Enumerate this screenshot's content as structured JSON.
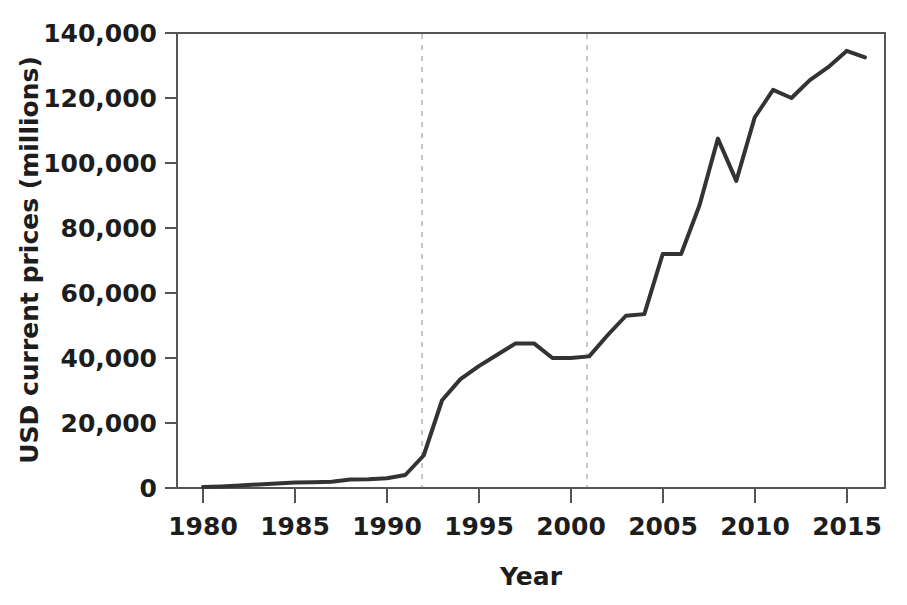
{
  "chart_data": {
    "type": "line",
    "title": "",
    "xlabel": "Year",
    "ylabel": "USD current prices (millions)",
    "xlim": [
      1980,
      2016
    ],
    "ylim": [
      0,
      140000
    ],
    "grid": false,
    "legend": null,
    "x_ticks": [
      "1980",
      "1985",
      "1990",
      "1995",
      "2000",
      "2005",
      "2010",
      "2015"
    ],
    "x_tick_values": [
      1980,
      1985,
      1990,
      1995,
      2000,
      2005,
      2010,
      2015
    ],
    "y_ticks": [
      "0",
      "20,000",
      "40,000",
      "60,000",
      "80,000",
      "100,000",
      "120,000",
      "140,000"
    ],
    "y_tick_values": [
      0,
      20000,
      40000,
      60000,
      80000,
      100000,
      120000,
      140000
    ],
    "annotations": [
      {
        "type": "vline",
        "x": 1992,
        "style": "dashed",
        "label": ""
      },
      {
        "type": "vline",
        "x": 2001,
        "style": "dashed",
        "label": ""
      }
    ],
    "series": [
      {
        "name": "USD current prices (millions)",
        "color": "#333333",
        "x": [
          1980,
          1981,
          1982,
          1983,
          1984,
          1985,
          1986,
          1987,
          1988,
          1989,
          1990,
          1991,
          1992,
          1993,
          1994,
          1995,
          1996,
          1997,
          1998,
          1999,
          2000,
          2001,
          2002,
          2003,
          2004,
          2005,
          2006,
          2007,
          2008,
          2009,
          2010,
          2011,
          2012,
          2013,
          2014,
          2015,
          2016
        ],
        "values": [
          300,
          500,
          800,
          1100,
          1400,
          1700,
          1800,
          1900,
          2600,
          2700,
          3000,
          4000,
          10000,
          27000,
          33500,
          37500,
          41000,
          44500,
          44500,
          40000,
          40000,
          40500,
          47000,
          53000,
          53500,
          72000,
          72000,
          87000,
          107500,
          94500,
          114000,
          122500,
          120000,
          125500,
          129500,
          134500,
          132500
        ]
      }
    ]
  },
  "axes": {
    "y_axis_title": "USD current prices (millions)",
    "x_axis_title": "Year"
  },
  "colors": {
    "line": "#333333",
    "axis": "#555555",
    "text": "#1d1d1d",
    "dashed_guide": "#cccccc",
    "background": "#ffffff"
  }
}
